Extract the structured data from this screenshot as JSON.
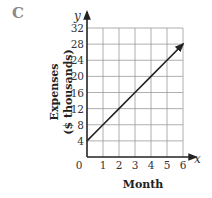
{
  "panel_label": "C",
  "chart_data": {
    "type": "line",
    "title": "",
    "xlabel": "Month",
    "ylabel": "Expenses ($ thousands)",
    "ylabel_lines": [
      "Expenses",
      "($ thousands)"
    ],
    "x_axis_var": "x",
    "y_axis_var": "y",
    "xlim": [
      0,
      6
    ],
    "ylim": [
      0,
      32
    ],
    "x_ticks": [
      "0",
      "1",
      "2",
      "3",
      "4",
      "5",
      "6"
    ],
    "y_ticks": [
      "4",
      "8",
      "12",
      "16",
      "20",
      "24",
      "28",
      "32"
    ],
    "grid": true,
    "series": [
      {
        "name": "Expenses",
        "x": [
          0,
          1,
          2,
          3,
          4,
          5,
          6
        ],
        "values": [
          4,
          8,
          12,
          16,
          20,
          24,
          28
        ],
        "arrow_end": true
      }
    ]
  }
}
